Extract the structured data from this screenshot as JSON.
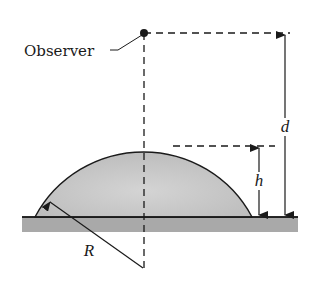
{
  "figure": {
    "labels": {
      "observer": "Observer",
      "d": "d",
      "h": "h",
      "R": "R"
    },
    "colors": {
      "line": "#1a1a1a",
      "dome_fill": "#c8c8c8",
      "ground_fill": "#a9a9a9",
      "background": "#ffffff"
    },
    "elements": [
      "observer-point",
      "vertical-dashed-axis",
      "dome",
      "ground",
      "height-arrow-d",
      "height-arrow-h",
      "radius-line-R"
    ]
  }
}
